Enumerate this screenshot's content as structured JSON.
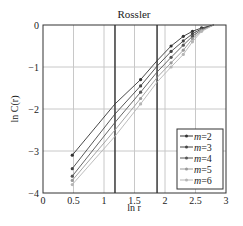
{
  "chart_data": {
    "type": "line",
    "title": "Rossler",
    "xlabel": "ln r",
    "ylabel": "ln C(r)",
    "xlim": [
      0,
      3
    ],
    "ylim": [
      -4,
      0
    ],
    "xticks": [
      0,
      0.5,
      1,
      1.5,
      2,
      2.5,
      3
    ],
    "xtick_labels": [
      "0",
      "0.5",
      "1",
      "1.5",
      "2",
      "2.5",
      "3"
    ],
    "yticks": [
      0,
      -1,
      -2,
      -3,
      -4
    ],
    "ytick_labels": [
      "0",
      "−1",
      "−2",
      "−3",
      "−4"
    ],
    "grid": true,
    "legend_position": "lower right",
    "vertical_markers": [
      1.18,
      1.87
    ],
    "x": [
      0.48,
      1.18,
      1.6,
      1.87,
      2.1,
      2.3,
      2.45,
      2.6,
      2.8
    ],
    "series": [
      {
        "name": "m=2",
        "label_m": "m",
        "label_v": "=2",
        "color": "#333333",
        "values": [
          -3.1,
          -1.88,
          -1.3,
          -0.85,
          -0.5,
          -0.27,
          -0.15,
          -0.07,
          0
        ]
      },
      {
        "name": "m=3",
        "label_m": "m",
        "label_v": "=3",
        "color": "#444444",
        "values": [
          -3.42,
          -2.12,
          -1.45,
          -0.98,
          -0.63,
          -0.38,
          -0.21,
          -0.09,
          0
        ]
      },
      {
        "name": "m=4",
        "label_m": "m",
        "label_v": "=4",
        "color": "#555555",
        "values": [
          -3.6,
          -2.32,
          -1.6,
          -1.12,
          -0.77,
          -0.48,
          -0.27,
          -0.11,
          0
        ]
      },
      {
        "name": "m=5",
        "label_m": "m",
        "label_v": "=5",
        "color": "#9a9a9a",
        "values": [
          -3.7,
          -2.5,
          -1.75,
          -1.25,
          -0.9,
          -0.6,
          -0.33,
          -0.13,
          0
        ]
      },
      {
        "name": "m=6",
        "label_m": "m",
        "label_v": "=6",
        "color": "#b5b5b5",
        "values": [
          -3.8,
          -2.65,
          -1.88,
          -1.36,
          -1.0,
          -0.7,
          -0.4,
          -0.15,
          0
        ]
      }
    ]
  }
}
